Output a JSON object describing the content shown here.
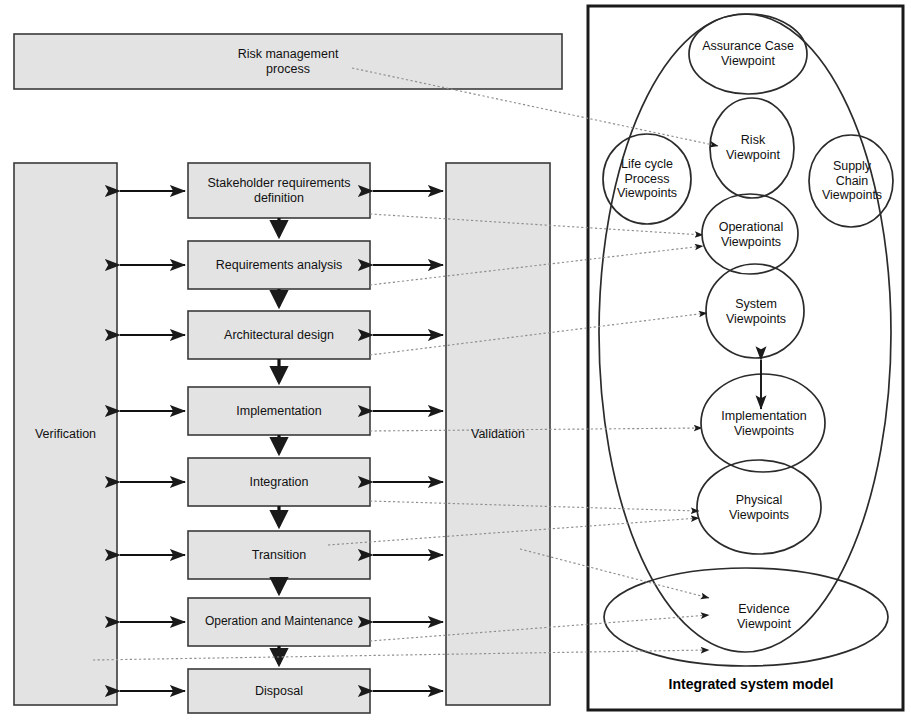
{
  "title_caption": "Integrated system model",
  "risk_process": {
    "label": "Risk management\nprocess"
  },
  "left_column": {
    "label": "Verification"
  },
  "right_column": {
    "label": "Validation"
  },
  "process_boxes": [
    {
      "id": "stakeholder-requirements-definition",
      "label": "Stakeholder requirements\ndefinition"
    },
    {
      "id": "requirements-analysis",
      "label": "Requirements analysis"
    },
    {
      "id": "architectural-design",
      "label": "Architectural design"
    },
    {
      "id": "implementation",
      "label": "Implementation"
    },
    {
      "id": "integration",
      "label": "Integration"
    },
    {
      "id": "transition",
      "label": "Transition"
    },
    {
      "id": "operation-and-maintenance",
      "label": "Operation and Maintenance"
    },
    {
      "id": "disposal",
      "label": "Disposal"
    }
  ],
  "viewpoints": [
    {
      "id": "assurance-case-viewpoint",
      "label": "Assurance Case\nViewpoint"
    },
    {
      "id": "life-cycle-process-viewpoints",
      "label": "Life cycle\nProcess\nViewpoints"
    },
    {
      "id": "risk-viewpoint",
      "label": "Risk\nViewpoint"
    },
    {
      "id": "supply-chain-viewpoints",
      "label": "Supply\nChain\nViewpoints"
    },
    {
      "id": "operational-viewpoints",
      "label": "Operational\nViewpoints"
    },
    {
      "id": "system-viewpoints",
      "label": "System\nViewpoints"
    },
    {
      "id": "implementation-viewpoints",
      "label": "Implementation\nViewpoints"
    },
    {
      "id": "physical-viewpoints",
      "label": "Physical\nViewpoints"
    },
    {
      "id": "evidence-viewpoint",
      "label": "Evidence\nViewpoint"
    }
  ],
  "colors": {
    "box_fill": "#e3e3e3",
    "box_stroke": "#3a3a3a",
    "frame_stroke": "#1a1a1a",
    "ellipse_stroke": "#2b2b2b",
    "connector": "#8a8a8a",
    "arrow": "#1a1a1a"
  }
}
